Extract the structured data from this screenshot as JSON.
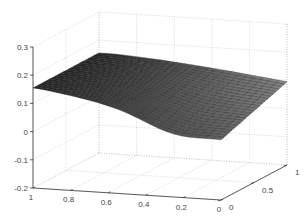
{
  "chart_data": {
    "type": "surface",
    "title": "",
    "xlabel": "",
    "ylabel": "",
    "zlabel": "",
    "x_ticks": [
      "1",
      "0.8",
      "0.6",
      "0.4",
      "0.2",
      "0"
    ],
    "y_ticks": [
      "0",
      "0.5",
      "1"
    ],
    "z_ticks": [
      "0.3",
      "0.2",
      "0.1",
      "0",
      "-0.1",
      "-0.2"
    ],
    "xlim": [
      0,
      1
    ],
    "ylim": [
      0,
      1
    ],
    "zlim": [
      -0.2,
      0.3
    ],
    "grid": true,
    "colormap": "gray",
    "surface_samples": {
      "description": "approximate z values at corners of the surface",
      "x1_y0": 0.15,
      "x1_y1": 0.155,
      "x0_y0": 0.02,
      "x0_y1": 0.09,
      "min_region_z": -0.02
    }
  },
  "colors": {
    "axis": "#333333",
    "grid": "#c8c8c8",
    "surface_dark": "#1a1a1a",
    "surface_light": "#9a9a9a"
  }
}
